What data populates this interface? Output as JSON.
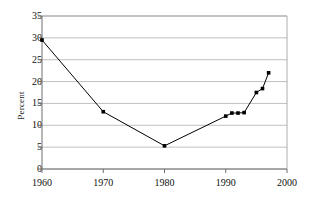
{
  "chart_data": {
    "type": "line",
    "title": "",
    "xlabel": "",
    "ylabel": "Percent",
    "xlim": [
      1960,
      2000
    ],
    "ylim": [
      0,
      35
    ],
    "grid": true,
    "grid_axis": "y",
    "legend": "none",
    "marker": "square",
    "marker_color": "#000000",
    "line_color": "#000000",
    "plot_background": "#ffffff",
    "grid_color": "#b0b0b0",
    "axis_color": "#808080",
    "text_color": "#111111",
    "ytick_labels": [
      "0",
      "5",
      "10",
      "15",
      "20",
      "25",
      "30",
      "35"
    ],
    "ytick_values": [
      0,
      5,
      10,
      15,
      20,
      25,
      30,
      35
    ],
    "xtick_labels": [
      "1960",
      "1970",
      "1980",
      "1990",
      "2000"
    ],
    "xtick_values": [
      1960,
      1970,
      1980,
      1990,
      2000
    ],
    "x": [
      1960,
      1970,
      1980,
      1990,
      1991,
      1992,
      1993,
      1995,
      1996,
      1997
    ],
    "values": [
      29.5,
      13.1,
      5.3,
      12.1,
      12.8,
      12.8,
      12.9,
      17.5,
      18.4,
      22.0
    ],
    "series": [
      {
        "name": "Percent",
        "x": [
          1960,
          1970,
          1980,
          1990,
          1991,
          1992,
          1993,
          1995,
          1996,
          1997
        ],
        "values": [
          29.5,
          13.1,
          5.3,
          12.1,
          12.8,
          12.8,
          12.9,
          17.5,
          18.4,
          22.0
        ]
      }
    ]
  }
}
